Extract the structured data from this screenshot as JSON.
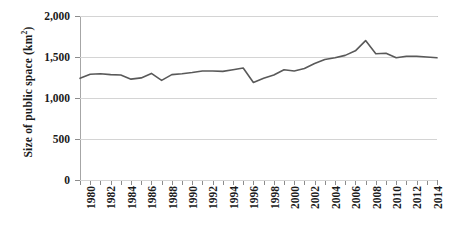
{
  "chart_data": {
    "type": "line",
    "title": "",
    "xlabel": "",
    "ylabel": "Size of public space (km²)",
    "ylabel_main": "Size of public space (km",
    "ylabel_unit_sup": "2",
    "ylabel_close": ")",
    "ylim": [
      0,
      2000
    ],
    "xlim": [
      1980,
      2015
    ],
    "grid": true,
    "legend": "none",
    "series_color": "#595959",
    "gridline_color": "#d4d4d4",
    "y_ticks": [
      0,
      500,
      1000,
      1500,
      2000
    ],
    "y_tick_labels": [
      "0",
      "500",
      "1,000",
      "1,500",
      "2,000"
    ],
    "x_tick_labels": [
      "1980",
      "1982",
      "1984",
      "1986",
      "1988",
      "1990",
      "1992",
      "1994",
      "1996",
      "1998",
      "2000",
      "2002",
      "2004",
      "2006",
      "2008",
      "2010",
      "2012",
      "2014"
    ],
    "x": [
      1980,
      1981,
      1982,
      1983,
      1984,
      1985,
      1986,
      1987,
      1988,
      1989,
      1990,
      1991,
      1992,
      1993,
      1994,
      1995,
      1996,
      1997,
      1998,
      1999,
      2000,
      2001,
      2002,
      2003,
      2004,
      2005,
      2006,
      2007,
      2008,
      2009,
      2010,
      2011,
      2012,
      2013,
      2014,
      2015
    ],
    "values": [
      1240,
      1290,
      1295,
      1285,
      1280,
      1230,
      1245,
      1300,
      1215,
      1285,
      1295,
      1310,
      1330,
      1330,
      1325,
      1345,
      1365,
      1190,
      1240,
      1280,
      1345,
      1330,
      1360,
      1420,
      1470,
      1490,
      1520,
      1575,
      1700,
      1540,
      1545,
      1490,
      1510,
      1510,
      1500,
      1490
    ],
    "series": [
      {
        "name": "Size of public space",
        "values": [
          1240,
          1290,
          1295,
          1285,
          1280,
          1230,
          1245,
          1300,
          1215,
          1285,
          1295,
          1310,
          1330,
          1330,
          1325,
          1345,
          1365,
          1190,
          1240,
          1280,
          1345,
          1330,
          1360,
          1420,
          1470,
          1490,
          1520,
          1575,
          1700,
          1540,
          1545,
          1490,
          1510,
          1510,
          1500,
          1490
        ]
      }
    ]
  }
}
